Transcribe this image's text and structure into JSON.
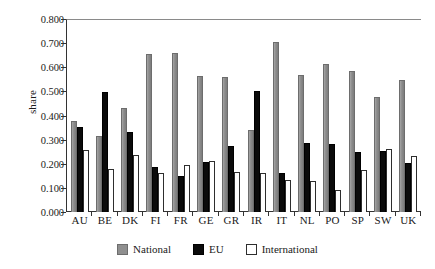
{
  "chart_data": {
    "type": "bar",
    "title": "",
    "xlabel": "",
    "ylabel": "share",
    "ylim": [
      0.0,
      0.8
    ],
    "ytick_labels": [
      "0.800",
      "0.700",
      "0.600",
      "0.500",
      "0.400",
      "0.300",
      "0.200",
      "0.100",
      "0.000"
    ],
    "ytick_values": [
      0.8,
      0.7,
      0.6,
      0.5,
      0.4,
      0.3,
      0.2,
      0.1,
      0.0
    ],
    "grid": false,
    "legend_position": "bottom",
    "categories": [
      "AU",
      "BE",
      "DK",
      "FI",
      "FR",
      "GE",
      "GR",
      "IR",
      "IT",
      "NL",
      "PO",
      "SP",
      "SW",
      "UK"
    ],
    "series": [
      {
        "name": "National",
        "color": "#8f8f8f",
        "values": [
          0.378,
          0.315,
          0.432,
          0.655,
          0.66,
          0.562,
          0.558,
          0.34,
          0.703,
          0.57,
          0.615,
          0.583,
          0.478,
          0.549
        ]
      },
      {
        "name": "EU",
        "color": "#0b0b0b",
        "values": [
          0.354,
          0.497,
          0.33,
          0.188,
          0.148,
          0.207,
          0.272,
          0.503,
          0.161,
          0.288,
          0.284,
          0.25,
          0.252,
          0.205
        ]
      },
      {
        "name": "International",
        "color": "#ffffff",
        "values": [
          0.258,
          0.18,
          0.235,
          0.16,
          0.193,
          0.212,
          0.165,
          0.16,
          0.132,
          0.13,
          0.093,
          0.173,
          0.262,
          0.231
        ]
      }
    ]
  },
  "legend": {
    "items": [
      {
        "label": "National",
        "key": "national"
      },
      {
        "label": "EU",
        "key": "eu"
      },
      {
        "label": "International",
        "key": "international"
      }
    ]
  }
}
